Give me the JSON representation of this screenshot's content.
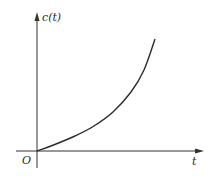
{
  "chart_data": {
    "type": "line",
    "title": "",
    "xlabel": "t",
    "ylabel": "c(t)",
    "origin_label": "O",
    "axis_ticks": "none",
    "data_scale": "normalized",
    "grid": false,
    "legend": "none",
    "series": [
      {
        "name": "c(t)",
        "x": [
          0,
          0.17,
          0.33,
          0.5,
          0.67,
          0.83,
          0.92,
          1.0
        ],
        "values": [
          0,
          0.06,
          0.14,
          0.25,
          0.41,
          0.63,
          0.8,
          1.0
        ]
      }
    ],
    "xlim": [
      0,
      1.5
    ],
    "ylim": [
      0,
      1.25
    ]
  },
  "labels": {
    "y_axis": "c(t)",
    "x_axis": "t",
    "origin": "O"
  },
  "colors": {
    "axis": "#333333",
    "curve": "#2b2b2b",
    "background": "#ffffff"
  },
  "geometry": {
    "origin_px": [
      37,
      151
    ],
    "x_axis_end_px": [
      204,
      151
    ],
    "y_axis_top_px": [
      37,
      12
    ],
    "curve_points_px": [
      [
        37,
        151
      ],
      [
        56,
        144
      ],
      [
        75,
        136
      ],
      [
        94,
        126
      ],
      [
        113,
        112
      ],
      [
        131,
        92
      ],
      [
        144,
        70
      ],
      [
        155,
        39
      ]
    ]
  }
}
